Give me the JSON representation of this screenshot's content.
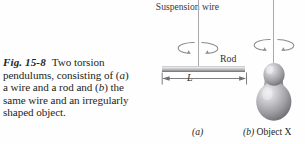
{
  "figure": {
    "number": "Fig. 15-8",
    "caption_text": "Two torsion pendulums, consisting of (a) a wire and a rod and (b) the same wire and an irregularly shaped object.",
    "caption_segments": {
      "s1": "Two torsion pendulums, consisting of (",
      "a1": "a",
      "s2": ") a wire and a rod and (",
      "b1": "b",
      "s3": ") the same wire and an irregularly shaped object."
    }
  },
  "diagram": {
    "suspension_label": "Suspension wire",
    "rod_label": "Rod",
    "length_label": "L",
    "panel_a_label": "(a)",
    "panel_b": {
      "marker": "(b)",
      "object_name": "Object X"
    }
  },
  "colors": {
    "text": "#231f20",
    "wire": "#a9a9ad",
    "rod_light": "#f2f2f2",
    "rod_dark": "#6e6e73",
    "arrow": "#8a8a8e",
    "object_light": "#e8e8ea",
    "object_mid": "#a6a6aa",
    "object_dark": "#6a6a6e",
    "background": "#fefefe"
  }
}
